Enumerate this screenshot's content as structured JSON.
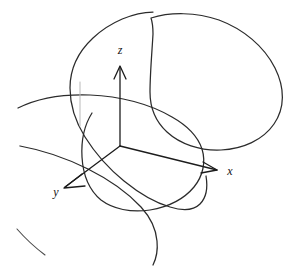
{
  "figure": {
    "title": "3D coordinate axes with intersecting elliptical curves",
    "width": 294,
    "height": 276,
    "background_color": "#ffffff",
    "ink_color": "#2b2b2b",
    "style": "hand-drawn line sketch"
  },
  "axes": {
    "origin": {
      "x": 120,
      "y": 146
    },
    "items": [
      {
        "id": "z",
        "label": "z",
        "label_x": 120,
        "label_y": 51,
        "direction": "up",
        "tip_x": 120,
        "tip_y": 66,
        "has_arrowhead": true
      },
      {
        "id": "x",
        "label": "x",
        "label_x": 229,
        "label_y": 172,
        "direction": "right-down",
        "tip_x": 216,
        "tip_y": 170,
        "has_arrowhead": true
      },
      {
        "id": "y",
        "label": "y",
        "label_x": 57,
        "label_y": 192,
        "direction": "left-down",
        "tip_x": 66,
        "tip_y": 186,
        "has_arrowhead": true
      }
    ]
  },
  "curves": [
    {
      "id": "ellipse-left-plane",
      "description": "large tilted ellipse on the left, passing behind the z-axis",
      "role": "plane-outline"
    },
    {
      "id": "ellipse-right-plane",
      "description": "large tilted ellipse on the upper right",
      "role": "plane-outline"
    },
    {
      "id": "ellipse-mid-plane",
      "description": "tilted ellipse through the origin tilting down to the right",
      "role": "plane-outline"
    },
    {
      "id": "arc-lower-left-tail",
      "description": "short detached arc at the lower left corner",
      "role": "partial-outline"
    },
    {
      "id": "arc-upper-left-tail",
      "description": "arc entering from the left edge near the z-axis",
      "role": "partial-outline"
    }
  ]
}
